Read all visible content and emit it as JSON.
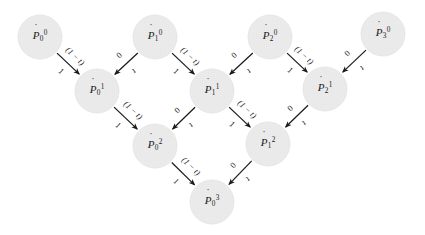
{
  "figure": {
    "type": "de-casteljau-pyramid",
    "background_color": "#ffffff",
    "node_fill_color": "#ebebeb",
    "node_stroke_color": "#e2e2e2",
    "edge_color": "#1b1b1b",
    "node_radius": 22
  },
  "nodes": [
    {
      "id": "p00",
      "base": "P",
      "accent": "̇",
      "sub": "0",
      "sup": "0",
      "text": "Ṗ0⁰",
      "x": 40,
      "y": 37,
      "row": 0,
      "col": 0
    },
    {
      "id": "p10",
      "base": "P",
      "accent": "̇",
      "sub": "1",
      "sup": "0",
      "text": "Ṗ1⁰",
      "x": 155,
      "y": 37,
      "row": 0,
      "col": 1
    },
    {
      "id": "p20",
      "base": "P",
      "accent": "̇",
      "sub": "2",
      "sup": "0",
      "text": "Ṗ2⁰",
      "x": 270,
      "y": 37,
      "row": 0,
      "col": 2
    },
    {
      "id": "p30",
      "base": "P",
      "accent": "̇",
      "sub": "3",
      "sup": "0",
      "text": "Ṗ3⁰",
      "x": 383,
      "y": 34,
      "row": 0,
      "col": 3
    },
    {
      "id": "p01",
      "base": "P",
      "accent": "̇",
      "sub": "0",
      "sup": "1",
      "text": "Ṗ0¹",
      "x": 97,
      "y": 91,
      "row": 1,
      "col": 0
    },
    {
      "id": "p11",
      "base": "P",
      "accent": "̇",
      "sub": "1",
      "sup": "1",
      "text": "Ṗ1¹",
      "x": 212,
      "y": 91,
      "row": 1,
      "col": 1
    },
    {
      "id": "p21",
      "base": "P",
      "accent": "̇",
      "sub": "2",
      "sup": "1",
      "text": "Ṗ2¹",
      "x": 325,
      "y": 89,
      "row": 1,
      "col": 2
    },
    {
      "id": "p02",
      "base": "P",
      "accent": "̇",
      "sub": "0",
      "sup": "2",
      "text": "Ṗ0²",
      "x": 155,
      "y": 146,
      "row": 2,
      "col": 0
    },
    {
      "id": "p12",
      "base": "P",
      "accent": "̇",
      "sub": "1",
      "sup": "2",
      "text": "Ṗ1²",
      "x": 268,
      "y": 144,
      "row": 2,
      "col": 1
    },
    {
      "id": "p03",
      "base": "P",
      "accent": "̇",
      "sub": "0",
      "sup": "3",
      "text": "Ṗ0³",
      "x": 212,
      "y": 202,
      "row": 3,
      "col": 0
    }
  ],
  "edges": [
    {
      "from": "p00",
      "to": "p01",
      "direction": "down-right",
      "label_upper": "(1 − t)",
      "label_lower": "1"
    },
    {
      "from": "p10",
      "to": "p01",
      "direction": "down-left",
      "label_upper": "t",
      "label_lower": "0"
    },
    {
      "from": "p10",
      "to": "p11",
      "direction": "down-right",
      "label_upper": "(1 − t)",
      "label_lower": "1"
    },
    {
      "from": "p20",
      "to": "p11",
      "direction": "down-left",
      "label_upper": "t",
      "label_lower": "0"
    },
    {
      "from": "p20",
      "to": "p21",
      "direction": "down-right",
      "label_upper": "(1 − t)",
      "label_lower": "1"
    },
    {
      "from": "p30",
      "to": "p21",
      "direction": "down-left",
      "label_upper": "t",
      "label_lower": "0"
    },
    {
      "from": "p01",
      "to": "p02",
      "direction": "down-right",
      "label_upper": "(1 − t)",
      "label_lower": "1"
    },
    {
      "from": "p11",
      "to": "p02",
      "direction": "down-left",
      "label_upper": "t",
      "label_lower": "0"
    },
    {
      "from": "p11",
      "to": "p12",
      "direction": "down-right",
      "label_upper": "(1 − t)",
      "label_lower": "1"
    },
    {
      "from": "p21",
      "to": "p12",
      "direction": "down-left",
      "label_upper": "t",
      "label_lower": "0"
    },
    {
      "from": "p02",
      "to": "p03",
      "direction": "down-right",
      "label_upper": "(1 − t)",
      "label_lower": "1"
    },
    {
      "from": "p12",
      "to": "p03",
      "direction": "down-left",
      "label_upper": "t",
      "label_lower": "0"
    }
  ]
}
